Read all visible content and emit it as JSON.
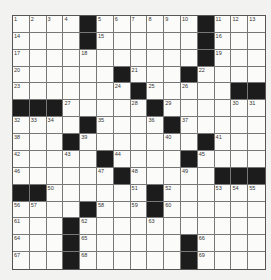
{
  "puzzle": {
    "size": 15,
    "blocks": [
      [
        0,
        4
      ],
      [
        0,
        11
      ],
      [
        1,
        4
      ],
      [
        1,
        11
      ],
      [
        2,
        11
      ],
      [
        3,
        6
      ],
      [
        3,
        10
      ],
      [
        4,
        7
      ],
      [
        4,
        13
      ],
      [
        4,
        14
      ],
      [
        5,
        0
      ],
      [
        5,
        1
      ],
      [
        5,
        2
      ],
      [
        5,
        8
      ],
      [
        6,
        4
      ],
      [
        6,
        9
      ],
      [
        7,
        3
      ],
      [
        7,
        11
      ],
      [
        8,
        5
      ],
      [
        8,
        10
      ],
      [
        9,
        6
      ],
      [
        9,
        12
      ],
      [
        9,
        13
      ],
      [
        9,
        14
      ],
      [
        10,
        0
      ],
      [
        10,
        1
      ],
      [
        10,
        8
      ],
      [
        11,
        4
      ],
      [
        11,
        8
      ],
      [
        12,
        3
      ],
      [
        13,
        3
      ],
      [
        13,
        10
      ],
      [
        14,
        3
      ],
      [
        14,
        10
      ]
    ],
    "numbers": [
      [
        0,
        0,
        1
      ],
      [
        0,
        1,
        2
      ],
      [
        0,
        2,
        3
      ],
      [
        0,
        3,
        4
      ],
      [
        0,
        5,
        5
      ],
      [
        0,
        6,
        6
      ],
      [
        0,
        7,
        7
      ],
      [
        0,
        8,
        8
      ],
      [
        0,
        9,
        9
      ],
      [
        0,
        10,
        10
      ],
      [
        0,
        12,
        11
      ],
      [
        0,
        13,
        12
      ],
      [
        0,
        14,
        13
      ],
      [
        1,
        0,
        14
      ],
      [
        1,
        5,
        15
      ],
      [
        1,
        12,
        16
      ],
      [
        2,
        0,
        17
      ],
      [
        2,
        4,
        18
      ],
      [
        2,
        12,
        19
      ],
      [
        3,
        0,
        20
      ],
      [
        3,
        7,
        21
      ],
      [
        3,
        11,
        22
      ],
      [
        4,
        0,
        23
      ],
      [
        4,
        6,
        24
      ],
      [
        4,
        8,
        25
      ],
      [
        4,
        10,
        26
      ],
      [
        5,
        3,
        27
      ],
      [
        5,
        7,
        28
      ],
      [
        5,
        9,
        29
      ],
      [
        5,
        13,
        30
      ],
      [
        5,
        14,
        31
      ],
      [
        6,
        0,
        32
      ],
      [
        6,
        1,
        33
      ],
      [
        6,
        2,
        34
      ],
      [
        6,
        5,
        35
      ],
      [
        6,
        8,
        36
      ],
      [
        6,
        10,
        37
      ],
      [
        7,
        0,
        38
      ],
      [
        7,
        4,
        39
      ],
      [
        7,
        9,
        40
      ],
      [
        7,
        12,
        41
      ],
      [
        8,
        0,
        42
      ],
      [
        8,
        3,
        43
      ],
      [
        8,
        6,
        44
      ],
      [
        8,
        11,
        45
      ],
      [
        9,
        0,
        46
      ],
      [
        9,
        5,
        47
      ],
      [
        9,
        7,
        48
      ],
      [
        9,
        10,
        49
      ],
      [
        10,
        2,
        50
      ],
      [
        10,
        7,
        51
      ],
      [
        10,
        9,
        52
      ],
      [
        10,
        12,
        53
      ],
      [
        10,
        13,
        54
      ],
      [
        10,
        14,
        55
      ],
      [
        11,
        0,
        56
      ],
      [
        11,
        1,
        57
      ],
      [
        11,
        5,
        58
      ],
      [
        11,
        7,
        59
      ],
      [
        11,
        9,
        60
      ],
      [
        12,
        0,
        61
      ],
      [
        12,
        4,
        62
      ],
      [
        12,
        8,
        63
      ],
      [
        13,
        0,
        64
      ],
      [
        13,
        4,
        65
      ],
      [
        13,
        11,
        66
      ],
      [
        14,
        0,
        67
      ],
      [
        14,
        4,
        68
      ],
      [
        14,
        11,
        69
      ]
    ]
  }
}
